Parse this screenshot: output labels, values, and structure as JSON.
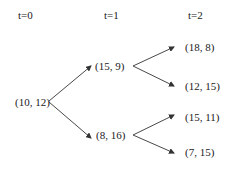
{
  "headers": {
    "t0": "t=0",
    "t1": "t=1",
    "t2": "t=2"
  },
  "nodes": {
    "root": "(10, 12)",
    "t1_up": "(15, 9)",
    "t1_down": "(8, 16)",
    "t2_up_up": "(18, 8)",
    "t2_up_down": "(12, 15)",
    "t2_down_up": "(15, 11)",
    "t2_down_down": "(7, 15)"
  },
  "colors": {
    "text": "#1a1a1a",
    "edge": "#333333",
    "background": "#ffffff"
  }
}
